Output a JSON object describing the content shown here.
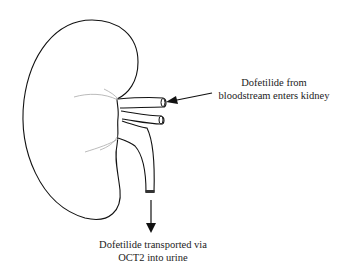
{
  "diagram": {
    "subject": "kidney",
    "labels": {
      "inflow_line1": "Dofetilide from",
      "inflow_line2": "bloodstream enters kidney",
      "outflow_line1": "Dofetilide transported via",
      "outflow_line2": "OCT2 into urine"
    },
    "colors": {
      "outline": "#111111",
      "hilum_lines": "#aaaaaa",
      "background": "#ffffff"
    }
  }
}
